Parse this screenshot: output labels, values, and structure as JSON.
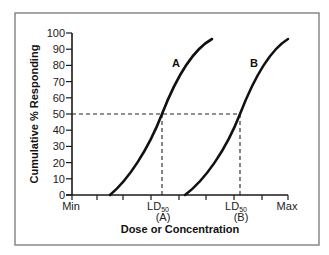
{
  "chart_data": {
    "type": "line",
    "title": "",
    "xlabel": "Dose or Concentration",
    "ylabel": "Cumulative % Responding",
    "ylim": [
      0,
      100
    ],
    "xlim": [
      "Min",
      "Max"
    ],
    "yticks": [
      0,
      10,
      20,
      30,
      40,
      50,
      60,
      70,
      80,
      90,
      100
    ],
    "xtick_labels": [
      {
        "id": "min",
        "text": "Min",
        "pos": 0
      },
      {
        "id": "ld50a",
        "text": "LD",
        "sub": "50",
        "line2": "(A)",
        "pos": 3.4
      },
      {
        "id": "ld50b",
        "text": "LD",
        "sub": "50",
        "line2": "(B)",
        "pos": 7.7
      },
      {
        "id": "max",
        "text": "Max",
        "pos": 10
      }
    ],
    "xtick_count": 9,
    "grid": false,
    "legend": null,
    "series": [
      {
        "name": "A",
        "label": "A",
        "x": [
          1.7,
          2.4,
          3.0,
          3.4,
          3.9,
          4.5,
          5.0,
          5.6
        ],
        "y": [
          0,
          10,
          30,
          50,
          68,
          84,
          92,
          97
        ]
      },
      {
        "name": "B",
        "label": "B",
        "x": [
          5.3,
          6.1,
          7.2,
          7.7,
          8.2,
          8.8,
          9.3,
          10.0
        ],
        "y": [
          0,
          10,
          32,
          50,
          68,
          84,
          92,
          97
        ]
      }
    ],
    "annotations": [
      {
        "type": "hline-dashed",
        "y": 50,
        "x_from": "Min",
        "x_to": "LD50 (B)"
      },
      {
        "type": "vline-dashed",
        "x": "LD50 (A)",
        "y_from": 0,
        "y_to": 50
      },
      {
        "type": "vline-dashed",
        "x": "LD50 (B)",
        "y_from": 0,
        "y_to": 50
      }
    ]
  },
  "labels": {
    "y_title": "Cumulative % Responding",
    "x_title": "Dose or Concentration",
    "curve_a": "A",
    "curve_b": "B",
    "x_min": "Min",
    "x_max": "Max",
    "ld_text": "LD",
    "ld_sub": "50",
    "ld_a_group": "(A)",
    "ld_b_group": "(B)",
    "y_ticks": [
      "0",
      "10",
      "20",
      "30",
      "40",
      "50",
      "60",
      "70",
      "80",
      "90",
      "100"
    ]
  }
}
